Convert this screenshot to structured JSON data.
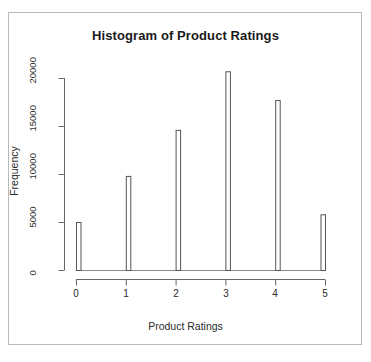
{
  "chart_data": {
    "type": "bar",
    "title": "Histogram of Product Ratings",
    "xlabel": "Product Ratings",
    "ylabel": "Frequency",
    "categories": [
      "0",
      "1",
      "2",
      "3",
      "4",
      "5"
    ],
    "values": [
      5000,
      9800,
      14600,
      20700,
      17700,
      5800
    ],
    "x": [
      0,
      1,
      2,
      3,
      4,
      5
    ],
    "xlim": [
      0,
      5
    ],
    "ylim": [
      0,
      20700
    ],
    "xticks": [
      "0",
      "1",
      "2",
      "3",
      "4",
      "5"
    ],
    "xtick_values": [
      0,
      1,
      2,
      3,
      4,
      5
    ],
    "yticks": [
      "0",
      "5000",
      "10000",
      "15000",
      "20000"
    ],
    "ytick_values": [
      0,
      5000,
      10000,
      15000,
      20000
    ],
    "grid": false,
    "legend": null,
    "bar_color": "#ffffff",
    "bar_edge_color": "#555555",
    "axis_color": "#666666",
    "title_color": "#1a1a1a",
    "background": "#ffffff",
    "frame_color": "#b9b9b9",
    "series": [
      {
        "name": "Frequency",
        "values": [
          5000,
          9800,
          14600,
          20700,
          17700,
          5800
        ]
      }
    ]
  },
  "plot": {
    "title": "Histogram of Product Ratings",
    "x_axis_title": "Product Ratings",
    "y_axis_title": "Frequency",
    "y_tick_labels": [
      "20000",
      "15000",
      "10000",
      "5000",
      "0"
    ],
    "x_tick_labels": [
      "0",
      "1",
      "2",
      "3",
      "4",
      "5"
    ]
  }
}
